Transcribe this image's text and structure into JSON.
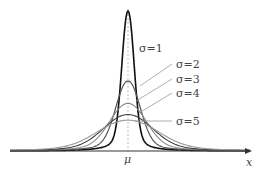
{
  "chart_data": {
    "type": "line",
    "title": "",
    "xlabel": "x",
    "ylabel": "",
    "center_label": "μ",
    "grid": false,
    "legend_position": "inline annotations right of curves",
    "x_range": [
      -10,
      10
    ],
    "series": [
      {
        "name": "σ=1",
        "sigma": 1,
        "peak": 1.0,
        "color": "#111111",
        "width": 1.6
      },
      {
        "name": "σ=2",
        "sigma": 2,
        "peak": 0.5,
        "color": "#555555",
        "width": 1.2
      },
      {
        "name": "σ=3",
        "sigma": 3,
        "peak": 0.34,
        "color": "#888888",
        "width": 1.1
      },
      {
        "name": "σ=4",
        "sigma": 4,
        "peak": 0.26,
        "color": "#444444",
        "width": 1.1
      },
      {
        "name": "σ=5",
        "sigma": 5,
        "peak": 0.22,
        "color": "#999999",
        "width": 1.1
      }
    ],
    "annotations": [
      {
        "text": "σ=1",
        "x": 139,
        "y": 52,
        "line": null
      },
      {
        "text": "σ=2",
        "x": 176,
        "y": 68,
        "line": [
          172,
          64,
          140,
          86
        ]
      },
      {
        "text": "σ=3",
        "x": 176,
        "y": 83,
        "line": [
          172,
          79,
          136,
          101
        ]
      },
      {
        "text": "σ=4",
        "x": 176,
        "y": 97,
        "line": [
          172,
          93,
          139,
          113
        ]
      },
      {
        "text": "σ=5",
        "x": 176,
        "y": 125,
        "line": [
          172,
          121,
          135,
          121
        ]
      }
    ]
  },
  "labels": {
    "x_axis": "x",
    "mu": "μ"
  }
}
